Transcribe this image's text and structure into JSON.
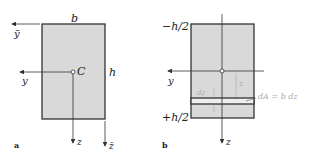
{
  "figure": {
    "panel_a": {
      "label": "a",
      "width_label": "b",
      "height_label": "h",
      "centroid_label": "C",
      "axes": {
        "y": "y",
        "z": "z",
        "y_bar": "ȳ",
        "z_bar": "z̄"
      }
    },
    "panel_b": {
      "label": "b",
      "top_label": "−h/2",
      "bottom_label": "+h/2",
      "axes": {
        "y": "y",
        "z": "z"
      },
      "strip_label": "dz",
      "z_dist_label": "z",
      "area_label": "dA = b dz"
    },
    "colors": {
      "fill": "#d9d9d9",
      "stroke": "#333333",
      "strip": "#eeeeee",
      "annotation": "#aaaaaa"
    }
  }
}
